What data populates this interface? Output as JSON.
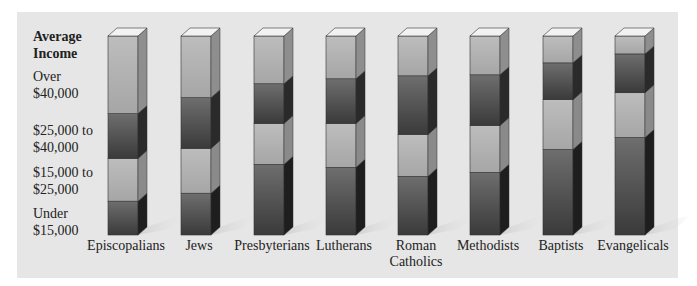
{
  "chart_data": {
    "type": "bar",
    "stacked": true,
    "percent": true,
    "title": "Average Income",
    "xlabel": "",
    "ylabel": "Average Income",
    "categories": [
      "Episcopalians",
      "Jews",
      "Presbyterians",
      "Lutherans",
      "Roman Catholics",
      "Methodists",
      "Baptists",
      "Evangelicals"
    ],
    "series": [
      {
        "name": "Under $15,000",
        "values": [
          17,
          21,
          35.5,
          34,
          29.5,
          31.5,
          43,
          49
        ]
      },
      {
        "name": "$15,000 to $25,000",
        "values": [
          21.5,
          22.5,
          20.5,
          22,
          21,
          23.5,
          25,
          22.5
        ]
      },
      {
        "name": "$25,000 to $40,000",
        "values": [
          22.5,
          25.5,
          20,
          22.5,
          29.5,
          25.5,
          18.5,
          19.5
        ]
      },
      {
        "name": "Over $40,000",
        "values": [
          39,
          31,
          24,
          21.5,
          20,
          19.5,
          13.5,
          9
        ]
      }
    ],
    "ylim": [
      0,
      100
    ],
    "grid": false,
    "legend_position": "left (row labels)"
  },
  "labels": {
    "title_line1": "Average",
    "title_line2": "Income",
    "rows": [
      {
        "l1": "Over",
        "l2": "$40,000"
      },
      {
        "l1": "$25,000 to",
        "l2": "$40,000"
      },
      {
        "l1": "$15,000 to",
        "l2": "$25,000"
      },
      {
        "l1": "Under",
        "l2": "$15,000"
      }
    ],
    "categories": [
      {
        "l1": "Episcopalians",
        "l2": ""
      },
      {
        "l1": "Jews",
        "l2": ""
      },
      {
        "l1": "Presbyterians",
        "l2": ""
      },
      {
        "l1": "Lutherans",
        "l2": ""
      },
      {
        "l1": "Roman",
        "l2": "Catholics"
      },
      {
        "l1": "Methodists",
        "l2": ""
      },
      {
        "l1": "Baptists",
        "l2": ""
      },
      {
        "l1": "Evangelicals",
        "l2": ""
      }
    ]
  },
  "colors": {
    "panel": "#e6e6e6",
    "light_segment": "#b4b4b4",
    "dark_segment": "#5a5a5a",
    "top_face": "#f2f2f2"
  }
}
